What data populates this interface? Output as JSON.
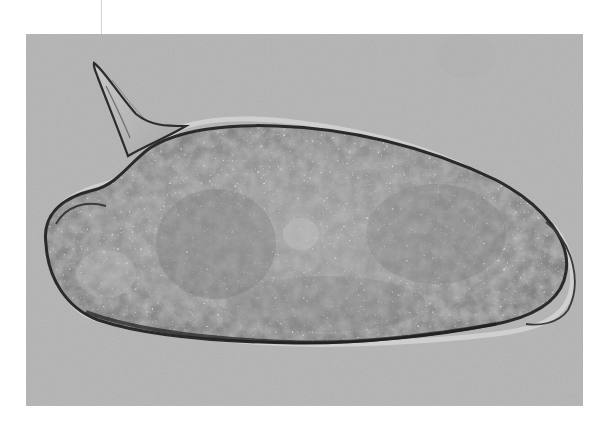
{
  "image": {
    "kind": "micrograph",
    "subject": "egg with lateral spine",
    "alt": "Grayscale brightfield micrograph of an elongated oval egg with a prominent pointed lateral spine at the upper left",
    "frame": {
      "x": 26,
      "y": 34,
      "width": 557,
      "height": 372
    },
    "colors": {
      "page_background": "#ffffff",
      "photo_background": "#bcbcbc",
      "egg_body_light": "#a8a8a8",
      "egg_body_dark": "#6e6e6e",
      "outline": "#2a2a2a",
      "spine_fill": "#b4b4b4"
    }
  }
}
